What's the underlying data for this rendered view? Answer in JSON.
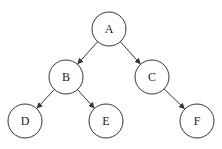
{
  "diagram": {
    "type": "binary-tree",
    "nodes": [
      {
        "id": "A",
        "label": "A",
        "x": 109,
        "y": 29
      },
      {
        "id": "B",
        "label": "B",
        "x": 66,
        "y": 77
      },
      {
        "id": "C",
        "label": "C",
        "x": 152,
        "y": 77
      },
      {
        "id": "D",
        "label": "D",
        "x": 25,
        "y": 121
      },
      {
        "id": "E",
        "label": "E",
        "x": 106,
        "y": 121
      },
      {
        "id": "F",
        "label": "F",
        "x": 197,
        "y": 121
      }
    ],
    "edges": [
      {
        "from": "A",
        "to": "B"
      },
      {
        "from": "A",
        "to": "C"
      },
      {
        "from": "B",
        "to": "D"
      },
      {
        "from": "B",
        "to": "E"
      },
      {
        "from": "C",
        "to": "F"
      }
    ],
    "radius": 17,
    "colors": {
      "stroke": "#333333",
      "fill": "#ffffff"
    }
  }
}
